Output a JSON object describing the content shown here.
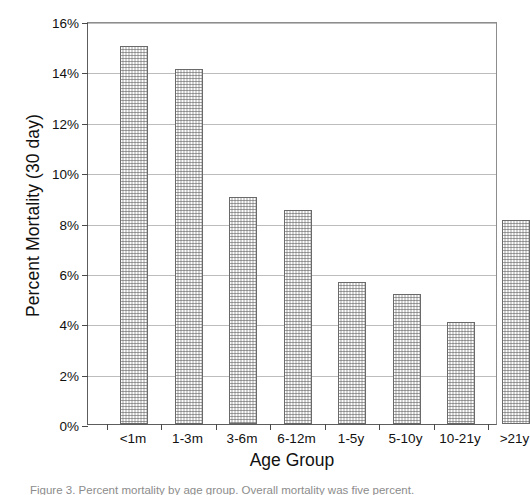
{
  "chart_data": {
    "type": "bar",
    "title": "",
    "xlabel": "Age Group",
    "ylabel": "Percent Mortality (30 day)",
    "categories": [
      "<1m",
      "1-3m",
      "3-6m",
      "6-12m",
      "1-5y",
      "5-10y",
      "10-21y",
      ">21y"
    ],
    "values": [
      15.0,
      14.1,
      9.0,
      8.5,
      5.65,
      5.15,
      4.05,
      8.1
    ],
    "ylim": [
      0,
      16
    ],
    "yticks": [
      0,
      2,
      4,
      6,
      8,
      10,
      12,
      14,
      16
    ],
    "ytick_labels": [
      "0%",
      "2%",
      "4%",
      "6%",
      "8%",
      "10%",
      "12%",
      "14%",
      "16%"
    ],
    "grid": "horizontal",
    "legend": "none",
    "series": [
      {
        "name": "Percent Mortality (30 day)",
        "values": [
          15.0,
          14.1,
          9.0,
          8.5,
          5.65,
          5.15,
          4.05,
          8.1
        ]
      }
    ]
  },
  "caption": {
    "text": "Figure 3. Percent mortality by age group. Overall mortality was five percent."
  },
  "colors": {
    "axis": "#5d5d5d",
    "gridline": "#bdbdbd",
    "bar_border": "#6a6a6a",
    "text": "#111111"
  }
}
